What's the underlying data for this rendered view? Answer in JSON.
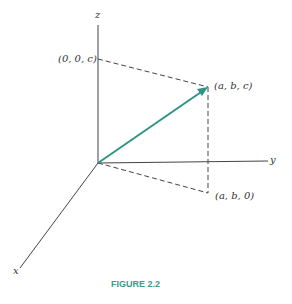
{
  "figure": {
    "caption": "FIGURE 2.2",
    "axes": {
      "x": "x",
      "y": "y",
      "z": "z"
    },
    "points": {
      "top": "(0, 0, c)",
      "tip": "(a, b, c)",
      "base": "(a, b, 0)"
    },
    "colors": {
      "vector": "#2e9484",
      "caption": "#3a9a8c",
      "axis": "#444444"
    }
  }
}
